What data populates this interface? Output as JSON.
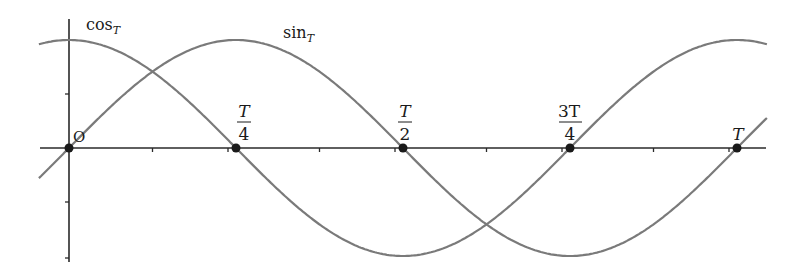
{
  "chart_data": {
    "type": "line",
    "title": "",
    "xlabel": "",
    "ylabel": "",
    "origin_label": "O",
    "x_ticks_labeled": [
      {
        "x": 0,
        "label_num": "",
        "label_den": "",
        "label": "O"
      },
      {
        "x": 0.25,
        "label_num": "T",
        "label_den": "4",
        "label": "T/4"
      },
      {
        "x": 0.5,
        "label_num": "T",
        "label_den": "2",
        "label": "T/2"
      },
      {
        "x": 0.75,
        "label_num": "3T",
        "label_den": "4",
        "label": "3T/4"
      },
      {
        "x": 1.0,
        "label_num": "",
        "label_den": "",
        "label": "T"
      }
    ],
    "x_range_in_periods": [
      -0.045,
      1.045
    ],
    "y_range": [
      -1.05,
      1.2
    ],
    "series": [
      {
        "name": "cos_T",
        "label_main": "cos",
        "label_sub": "T",
        "function": "cos(2*pi*t/T)",
        "color": "#7a7a7a"
      },
      {
        "name": "sin_T",
        "label_main": "sin",
        "label_sub": "T",
        "function": "sin(2*pi*t/T)",
        "color": "#7a7a7a"
      }
    ],
    "marked_points": [
      {
        "x": 0,
        "y": 0
      },
      {
        "x": 0.25,
        "y": 0
      },
      {
        "x": 0.5,
        "y": 0
      },
      {
        "x": 0.75,
        "y": 0
      },
      {
        "x": 1.0,
        "y": 0
      }
    ],
    "grid": false,
    "legend": "inline labels near curves"
  },
  "colors": {
    "axis": "#2a2a2a",
    "curve": "#7a7a7a",
    "point": "#1a1a1a"
  }
}
